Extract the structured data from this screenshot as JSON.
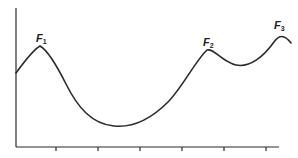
{
  "figure": {
    "peaks": [
      {
        "label": "F",
        "subscript": "1",
        "x": 40,
        "y": 46
      },
      {
        "label": "F",
        "subscript": "2",
        "x": 207,
        "y": 50
      },
      {
        "label": "F",
        "subscript": "3",
        "x": 282,
        "y": 36
      }
    ],
    "x_axis": {
      "ticks": 6
    },
    "colors": {
      "line": "#2a2a2a",
      "background": "#ffffff"
    }
  }
}
